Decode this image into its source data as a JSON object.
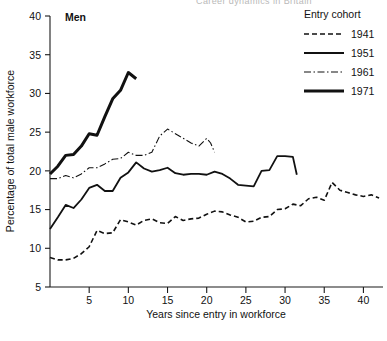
{
  "figure": {
    "panel_label": "Men",
    "cropped_header_text": "Career dynamics in Britain",
    "background_color": "#ffffff",
    "ink_color": "#111111"
  },
  "legend": {
    "title": "Entry cohort",
    "position": "top-right",
    "entries": [
      {
        "label": "1941",
        "style": "dashed",
        "dash_array": "5,3",
        "width": 1.6
      },
      {
        "label": "1951",
        "style": "solid",
        "dash_array": "none",
        "width": 1.8
      },
      {
        "label": "1961",
        "style": "dash-dot",
        "dash_array": "7,2.5,1.5,2.5",
        "width": 1.1
      },
      {
        "label": "1971",
        "style": "solid-thick",
        "dash_array": "none",
        "width": 3.0
      }
    ]
  },
  "chart_data": {
    "type": "line",
    "title": "Men",
    "xlabel": "Years since entry in workforce",
    "ylabel": "Percentage of total male workforce",
    "xlim": [
      0,
      42.5
    ],
    "ylim": [
      5,
      40
    ],
    "xticks": [
      5,
      10,
      15,
      20,
      25,
      30,
      35,
      40
    ],
    "yticks": [
      5,
      10,
      15,
      20,
      25,
      30,
      35,
      40
    ],
    "grid": false,
    "legend_position": "top-right",
    "legend_title": "Entry cohort",
    "series": [
      {
        "name": "1941",
        "style": "dashed",
        "x": [
          0,
          1,
          2,
          3,
          4,
          5,
          6,
          7,
          8,
          9,
          10,
          11,
          12,
          13,
          14,
          15,
          16,
          17,
          18,
          19,
          20,
          21,
          22,
          23,
          24,
          25,
          26,
          27,
          28,
          29,
          30,
          31,
          32,
          33,
          34,
          35,
          36,
          37,
          38,
          39,
          40,
          41,
          42
        ],
        "values": [
          8.8,
          8.5,
          8.5,
          8.7,
          9.3,
          10.2,
          12.3,
          11.9,
          12.0,
          13.7,
          13.4,
          13.0,
          13.6,
          13.8,
          13.3,
          13.2,
          14.1,
          13.6,
          13.8,
          13.9,
          14.4,
          14.8,
          14.7,
          14.3,
          14.0,
          13.4,
          13.5,
          14.0,
          14.1,
          15.0,
          15.1,
          15.7,
          15.5,
          16.4,
          16.6,
          16.2,
          18.5,
          17.5,
          17.2,
          16.9,
          16.7,
          16.9,
          16.5
        ]
      },
      {
        "name": "1951",
        "style": "solid",
        "x": [
          0,
          1,
          2,
          3,
          4,
          5,
          6,
          7,
          8,
          9,
          10,
          11,
          12,
          13,
          14,
          15,
          16,
          17,
          18,
          19,
          20,
          21,
          22,
          23,
          24,
          25,
          26,
          27,
          28,
          29,
          30,
          31,
          31.5
        ],
        "values": [
          12.5,
          14.0,
          15.6,
          15.2,
          16.3,
          17.8,
          18.2,
          17.4,
          17.4,
          19.1,
          19.8,
          21.1,
          20.3,
          19.9,
          20.1,
          20.4,
          19.7,
          19.5,
          19.6,
          19.6,
          19.5,
          19.9,
          19.6,
          19.0,
          18.2,
          18.1,
          18.0,
          20.0,
          20.1,
          21.9,
          21.9,
          21.8,
          19.5
        ]
      },
      {
        "name": "1961",
        "style": "dash-dot",
        "x": [
          0,
          1,
          2,
          3,
          4,
          5,
          6,
          7,
          8,
          9,
          10,
          11,
          12,
          13,
          14,
          15,
          16,
          17,
          18,
          19,
          20,
          20.5,
          21
        ],
        "values": [
          19.0,
          19.0,
          19.4,
          19.1,
          19.6,
          20.4,
          20.4,
          20.9,
          21.5,
          21.6,
          22.4,
          22.0,
          22.0,
          22.4,
          24.5,
          25.4,
          24.8,
          24.2,
          23.6,
          23.2,
          24.2,
          23.6,
          22.4
        ]
      },
      {
        "name": "1971",
        "style": "solid-thick",
        "x": [
          0,
          1,
          2,
          3,
          4,
          5,
          6,
          7,
          8,
          9,
          10,
          11
        ],
        "values": [
          19.6,
          20.6,
          22.0,
          22.1,
          23.2,
          24.8,
          24.6,
          27.0,
          29.3,
          30.4,
          32.7,
          31.9
        ]
      }
    ]
  }
}
